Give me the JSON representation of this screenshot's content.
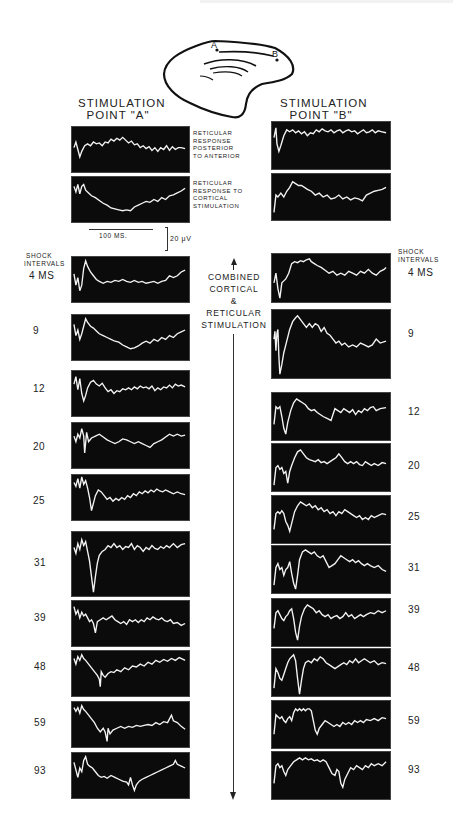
{
  "figure": {
    "brain_diagram": {
      "point_a_label": "A",
      "point_b_label": "B"
    },
    "columns": [
      {
        "heading_line1": "STIMULATION",
        "heading_line2": "POINT \"A\"",
        "top_traces": [
          {
            "label_lines": [
              "RETICULAR",
              "RESPONSE",
              "POSTERIOR",
              "TO ANTERIOR"
            ]
          },
          {
            "label_lines": [
              "RETICULAR",
              "RESPONSE TO",
              "CORTICAL",
              "STIMULATION"
            ]
          }
        ]
      },
      {
        "heading_line1": "STIMULATION",
        "heading_line2": "POINT \"B\""
      }
    ],
    "scale_bar": {
      "time": "100 MS.",
      "voltage": "20 μV"
    },
    "shock_intervals_label_line1": "SHOCK",
    "shock_intervals_label_line2": "INTERVALS",
    "center_label_lines": [
      "COMBINED",
      "CORTICAL",
      "&",
      "RETICULAR",
      "STIMULATION"
    ],
    "intervals": [
      "4 MS",
      "9",
      "12",
      "20",
      "25",
      "31",
      "39",
      "48",
      "59",
      "93"
    ],
    "trace_color": "#f2f2f2",
    "panel_color": "#0b0b0b"
  }
}
